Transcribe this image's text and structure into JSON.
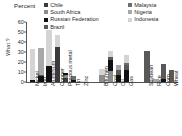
{
  "axis_title": "What ?",
  "percent_label": "Percent",
  "legend": {
    "left_column": [
      {
        "label": "Chile",
        "color": "#3a3a3a"
      },
      {
        "label": "South Africa",
        "color": "#8c8c8c"
      },
      {
        "label": "Russian Federation",
        "color": "#111111"
      },
      {
        "label": "Brazil",
        "color": "#595959"
      }
    ],
    "right_column": [
      {
        "label": "Malaysia",
        "color": "#6e6e6e"
      },
      {
        "label": "Nigeria",
        "color": "#a8a8a8"
      },
      {
        "label": "Indonesia",
        "color": "#d4d4d4"
      }
    ]
  },
  "chart_data": {
    "type": "bar",
    "stacked": true,
    "title": "",
    "subtitle": "Percent",
    "xlabel": "",
    "ylabel": "What ?",
    "ylim": [
      0,
      60
    ],
    "yticks": [
      0,
      10,
      20,
      30,
      40,
      50,
      60
    ],
    "grid": false,
    "legend_position": "top",
    "groups": [
      "Metals",
      "Energy",
      "Agriculture"
    ],
    "categories": [
      "Nickel",
      "Iron",
      "Aluminium",
      "Copper",
      "Precious metal",
      "Tin",
      "Zinc",
      "Bitumen",
      "Coal",
      "Oil",
      "Gas",
      "Soybean",
      "Rice",
      "Corn",
      "Wheat"
    ],
    "series": [
      {
        "name": "Chile",
        "color": "#3a3a3a",
        "values": [
          0,
          0,
          0,
          35,
          4,
          0,
          0,
          0,
          0,
          0,
          0,
          0,
          0,
          0,
          0
        ]
      },
      {
        "name": "South Africa",
        "color": "#8c8c8c",
        "values": [
          0,
          0,
          0,
          0,
          3,
          0,
          0,
          7,
          11,
          0,
          0,
          0,
          0,
          0,
          0
        ]
      },
      {
        "name": "Russian Federation",
        "color": "#111111",
        "values": [
          2,
          6,
          16,
          0,
          2,
          2,
          0,
          0,
          11,
          7,
          12,
          0,
          0,
          3,
          0
        ]
      },
      {
        "name": "Brazil",
        "color": "#595959",
        "values": [
          0,
          1,
          0,
          0,
          0,
          0,
          0,
          0,
          3,
          5,
          5,
          31,
          0,
          15,
          12
        ]
      },
      {
        "name": "Malaysia",
        "color": "#6e6e6e",
        "values": [
          0,
          0,
          0,
          0,
          0,
          4,
          0,
          0,
          0,
          0,
          2,
          0,
          0,
          0,
          0
        ]
      },
      {
        "name": "Nigeria",
        "color": "#a8a8a8",
        "values": [
          0,
          27,
          0,
          0,
          0,
          0,
          0,
          0,
          0,
          5,
          0,
          0,
          3,
          0,
          0
        ]
      },
      {
        "name": "Indonesia",
        "color": "#d4d4d4",
        "values": [
          31,
          0,
          36,
          12,
          0,
          0,
          1,
          6,
          6,
          0,
          8,
          0,
          0,
          0,
          0
        ]
      }
    ],
    "totals": [
      33,
      34,
      52,
      47,
      9,
      6,
      1,
      13,
      31,
      17,
      27,
      31,
      3,
      18,
      12
    ],
    "group_breaks_after": [
      "Zinc",
      "Gas"
    ]
  }
}
